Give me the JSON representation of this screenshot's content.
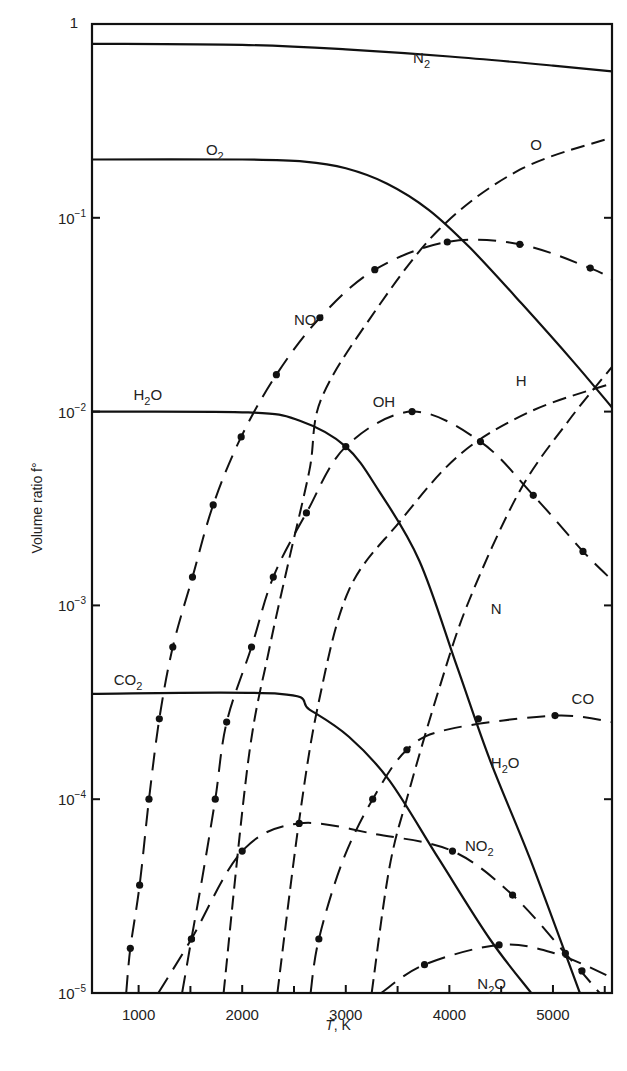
{
  "chart_data": {
    "type": "line",
    "title": "",
    "xlabel": "T, K",
    "ylabel": "Volume ratio f°",
    "xscale": "linear",
    "yscale": "log",
    "xlim": [
      550,
      5570
    ],
    "ylim": [
      1e-05,
      1
    ],
    "grid": false,
    "legend": "inline labels",
    "x_ticks": [
      1000,
      2000,
      3000,
      4000,
      5000
    ],
    "x_tick_labels": [
      "1000",
      "2000",
      "3000",
      "4000",
      "5000"
    ],
    "x_minor_ticks": [
      1500,
      2500,
      3500,
      4500,
      5500
    ],
    "y_ticks": [
      1,
      0.1,
      0.01,
      0.001,
      0.0001,
      1e-05
    ],
    "y_tick_labels": [
      {
        "base": "1",
        "exp": ""
      },
      {
        "base": "10",
        "exp": "−1"
      },
      {
        "base": "10",
        "exp": "−2"
      },
      {
        "base": "10",
        "exp": "−3"
      },
      {
        "base": "10",
        "exp": "−4"
      },
      {
        "base": "10",
        "exp": "−5"
      }
    ],
    "series": [
      {
        "name": "N2",
        "label": "N",
        "sub": "2",
        "style": "solid",
        "label_pos": [
          3650,
          0.63
        ],
        "points": [
          [
            550,
            0.79
          ],
          [
            2000,
            0.78
          ],
          [
            3000,
            0.74
          ],
          [
            4000,
            0.68
          ],
          [
            5000,
            0.61
          ],
          [
            5570,
            0.57
          ]
        ]
      },
      {
        "name": "O2",
        "label": "O",
        "sub": "2",
        "style": "solid",
        "label_pos": [
          1650,
          0.21
        ],
        "points": [
          [
            550,
            0.2
          ],
          [
            2000,
            0.2
          ],
          [
            2600,
            0.195
          ],
          [
            3000,
            0.18
          ],
          [
            3400,
            0.15
          ],
          [
            3800,
            0.11
          ],
          [
            4200,
            0.07
          ],
          [
            4700,
            0.036
          ],
          [
            5200,
            0.018
          ],
          [
            5570,
            0.0105
          ]
        ]
      },
      {
        "name": "O",
        "label": "O",
        "sub": "",
        "style": "dashed",
        "label_pos": [
          4780,
          0.225
        ],
        "points": [
          [
            1820,
            1e-05
          ],
          [
            2060,
            0.00016
          ],
          [
            2260,
            0.00059
          ],
          [
            2450,
            0.0017
          ],
          [
            2650,
            0.005
          ],
          [
            2760,
            0.0115
          ],
          [
            3230,
            0.03
          ],
          [
            3900,
            0.087
          ],
          [
            4680,
            0.177
          ],
          [
            5570,
            0.26
          ]
        ]
      },
      {
        "name": "NO",
        "label": "NO",
        "sub": "",
        "style": "dashdot-dots",
        "label_pos": [
          2500,
          0.028
        ],
        "points": [
          [
            880,
            1e-05
          ],
          [
            920,
            1.7e-05
          ],
          [
            1010,
            3.6e-05
          ],
          [
            1100,
            0.0001
          ],
          [
            1200,
            0.00026
          ],
          [
            1330,
            0.00061
          ],
          [
            1520,
            0.0014
          ],
          [
            1720,
            0.0033
          ],
          [
            1990,
            0.0074
          ],
          [
            2330,
            0.0155
          ],
          [
            2750,
            0.0305
          ],
          [
            3280,
            0.054
          ],
          [
            3980,
            0.075
          ],
          [
            4680,
            0.073
          ],
          [
            5360,
            0.055
          ],
          [
            5570,
            0.048
          ]
        ],
        "markers": [
          [
            920,
            1.7e-05
          ],
          [
            1010,
            3.6e-05
          ],
          [
            1100,
            0.0001
          ],
          [
            1200,
            0.00026
          ],
          [
            1330,
            0.00061
          ],
          [
            1520,
            0.0014
          ],
          [
            1720,
            0.0033
          ],
          [
            1990,
            0.0074
          ],
          [
            2330,
            0.0155
          ],
          [
            2750,
            0.0305
          ],
          [
            3280,
            0.054
          ],
          [
            3980,
            0.075
          ],
          [
            4680,
            0.073
          ],
          [
            5360,
            0.055
          ]
        ]
      },
      {
        "name": "H2O",
        "label": "H",
        "sub": "2",
        "tail": "O",
        "style": "solid",
        "label_pos": [
          950,
          0.0115
        ],
        "points": [
          [
            550,
            0.01
          ],
          [
            2060,
            0.0099
          ],
          [
            2550,
            0.009
          ],
          [
            3000,
            0.0066
          ],
          [
            3320,
            0.0039
          ],
          [
            3710,
            0.0017
          ],
          [
            4070,
            0.00049
          ],
          [
            4390,
            0.00016
          ],
          [
            4780,
            4.9e-05
          ],
          [
            5260,
            1e-05
          ]
        ]
      },
      {
        "name": "H2O (high-T label)",
        "label": "H",
        "sub": "2",
        "tail": "O",
        "style": "label-only",
        "label_pos": [
          4400,
          0.000145
        ],
        "points": []
      },
      {
        "name": "OH",
        "label": "OH",
        "sub": "",
        "style": "dashdot-dots",
        "label_pos": [
          3260,
          0.0105
        ],
        "points": [
          [
            1420,
            1e-05
          ],
          [
            1510,
            1.9e-05
          ],
          [
            1610,
            3.8e-05
          ],
          [
            1740,
            0.0001
          ],
          [
            1850,
            0.00025
          ],
          [
            2090,
            0.00061
          ],
          [
            2300,
            0.0014
          ],
          [
            2620,
            0.003
          ],
          [
            3000,
            0.0066
          ],
          [
            3640,
            0.01
          ],
          [
            4300,
            0.007
          ],
          [
            4810,
            0.0037
          ],
          [
            5290,
            0.0019
          ],
          [
            5570,
            0.00135
          ]
        ],
        "markers": [
          [
            1510,
            1.9e-05
          ],
          [
            1740,
            0.0001
          ],
          [
            1850,
            0.00025
          ],
          [
            2090,
            0.00061
          ],
          [
            2300,
            0.0014
          ],
          [
            2620,
            0.003
          ],
          [
            3000,
            0.0066
          ],
          [
            3640,
            0.01
          ],
          [
            4300,
            0.007
          ],
          [
            4810,
            0.0037
          ],
          [
            5290,
            0.0019
          ]
        ]
      },
      {
        "name": "H",
        "label": "H",
        "sub": "",
        "style": "dashed",
        "label_pos": [
          4640,
          0.0135
        ],
        "points": [
          [
            2340,
            1e-05
          ],
          [
            2550,
            7.8e-05
          ],
          [
            2740,
            0.00032
          ],
          [
            3030,
            0.0012
          ],
          [
            3520,
            0.0027
          ],
          [
            4100,
            0.006
          ],
          [
            4780,
            0.01
          ],
          [
            5570,
            0.014
          ]
        ]
      },
      {
        "name": "N",
        "label": "N",
        "sub": "",
        "style": "dashed",
        "label_pos": [
          4400,
          0.0009
        ],
        "points": [
          [
            3250,
            1e-05
          ],
          [
            3420,
            4.4e-05
          ],
          [
            3610,
            0.00011
          ],
          [
            3900,
            0.00037
          ],
          [
            4190,
            0.00106
          ],
          [
            4680,
            0.0039
          ],
          [
            5160,
            0.0091
          ],
          [
            5570,
            0.017
          ]
        ]
      },
      {
        "name": "CO2",
        "label": "CO",
        "sub": "2",
        "style": "solid",
        "label_pos": [
          760,
          0.00039
        ],
        "points": [
          [
            550,
            0.00035
          ],
          [
            2360,
            0.00035
          ],
          [
            2650,
            0.00029
          ],
          [
            3030,
            0.00021
          ],
          [
            3420,
            0.000125
          ],
          [
            3900,
            4.9e-05
          ],
          [
            4390,
            1.9e-05
          ],
          [
            4790,
            1e-05
          ]
        ]
      },
      {
        "name": "CO",
        "label": "CO",
        "sub": "",
        "style": "dashdot-dots",
        "label_pos": [
          5180,
          0.00031
        ],
        "points": [
          [
            2660,
            1e-05
          ],
          [
            2740,
            1.9e-05
          ],
          [
            2970,
            4.8e-05
          ],
          [
            3260,
            0.0001
          ],
          [
            3590,
            0.00018
          ],
          [
            4000,
            0.00023
          ],
          [
            5020,
            0.00027
          ],
          [
            5570,
            0.00025
          ]
        ],
        "markers": [
          [
            2740,
            1.9e-05
          ],
          [
            3260,
            0.0001
          ],
          [
            3590,
            0.00018
          ],
          [
            4280,
            0.00026
          ],
          [
            5020,
            0.00027
          ]
        ]
      },
      {
        "name": "NO2",
        "label": "NO",
        "sub": "2",
        "style": "dashdot-dots",
        "label_pos": [
          4150,
          5.4e-05
        ],
        "points": [
          [
            1190,
            1e-05
          ],
          [
            1510,
            1.9e-05
          ],
          [
            2000,
            5.4e-05
          ],
          [
            2550,
            7.5e-05
          ],
          [
            3290,
            6.6e-05
          ],
          [
            4030,
            5.4e-05
          ],
          [
            4610,
            3.2e-05
          ],
          [
            5120,
            1.6e-05
          ],
          [
            5450,
            1e-05
          ]
        ],
        "markers": [
          [
            1510,
            1.9e-05
          ],
          [
            2000,
            5.4e-05
          ],
          [
            2550,
            7.5e-05
          ],
          [
            4030,
            5.4e-05
          ],
          [
            4610,
            3.2e-05
          ],
          [
            5120,
            1.6e-05
          ],
          [
            5280,
            1.3e-05
          ]
        ]
      },
      {
        "name": "N2O",
        "label": "N",
        "sub": "2",
        "tail": "O",
        "style": "dashdot-dots",
        "label_pos": [
          4270,
          1.05e-05
        ],
        "points": [
          [
            3340,
            1e-05
          ],
          [
            3760,
            1.4e-05
          ],
          [
            4480,
            1.77e-05
          ],
          [
            5020,
            1.6e-05
          ],
          [
            5570,
            1.2e-05
          ]
        ],
        "markers": [
          [
            3760,
            1.4e-05
          ],
          [
            4480,
            1.77e-05
          ]
        ]
      }
    ]
  }
}
